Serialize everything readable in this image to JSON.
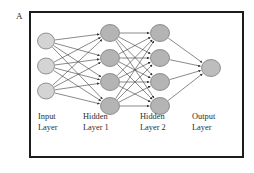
{
  "figure": {
    "panel_label": "A",
    "type": "neural-network-architecture-diagram"
  },
  "labels": {
    "input": "Input\nLayer",
    "hidden1": "Hidden\nLayer 1",
    "hidden2": "Hidden\nLayer 2",
    "output": "Output\nLayer"
  },
  "colors": {
    "border": "#1c1c1c",
    "input_node_fill": "#d4d4d4",
    "hidden_node_fill": "#b4b4b4",
    "output_node_fill": "#bdbdbd",
    "node_stroke": "#6e6e6e",
    "edge": "#3a3a3a",
    "background": "#ffffff",
    "text": "#2e2e2e"
  },
  "chart_data": {
    "type": "diagram",
    "title": "",
    "layers": [
      {
        "name": "Input Layer",
        "id": "input",
        "node_count": 3,
        "cx": 46,
        "rx": 8.5,
        "ry": 8.0,
        "fill": "#d4d4d4",
        "nodes_cy": [
          41,
          66,
          91
        ]
      },
      {
        "name": "Hidden Layer 1",
        "id": "hidden1",
        "node_count": 4,
        "cx": 110,
        "rx": 9.5,
        "ry": 8.5,
        "fill": "#b4b4b4",
        "nodes_cy": [
          33,
          58,
          82,
          106
        ]
      },
      {
        "name": "Hidden Layer 2",
        "id": "hidden2",
        "node_count": 4,
        "cx": 160,
        "rx": 9.5,
        "ry": 8.5,
        "fill": "#b4b4b4",
        "nodes_cy": [
          33,
          58,
          82,
          106
        ]
      },
      {
        "name": "Output Layer",
        "id": "output",
        "node_count": 1,
        "cx": 211,
        "rx": 9.5,
        "ry": 8.5,
        "fill": "#bdbdbd",
        "nodes_cy": [
          68
        ]
      }
    ],
    "connections": [
      {
        "from": "input",
        "to": "hidden1",
        "pattern": "fully-connected",
        "directed": true
      },
      {
        "from": "hidden1",
        "to": "hidden2",
        "pattern": "fully-connected",
        "directed": true
      },
      {
        "from": "hidden2",
        "to": "output",
        "pattern": "fully-connected",
        "directed": true
      }
    ]
  }
}
